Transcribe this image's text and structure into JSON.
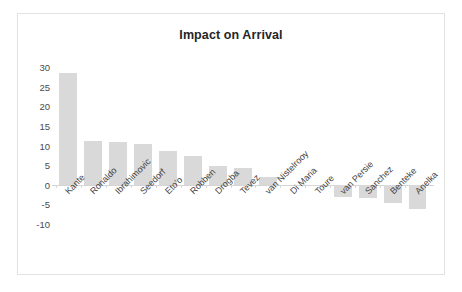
{
  "chart": {
    "title": "Impact on Arrival"
  },
  "chart_data": {
    "type": "bar",
    "title": "Impact on Arrival",
    "xlabel": "",
    "ylabel": "",
    "ylim": [
      -10,
      30
    ],
    "yticks": [
      30,
      25,
      20,
      15,
      10,
      5,
      0,
      -5,
      -10
    ],
    "grid": false,
    "legend": false,
    "bar_color": "#d9d9d9",
    "categories": [
      "Kante",
      "Ronaldo",
      "Ibrahimovic",
      "Seedorf",
      "Eto'o",
      "Robben",
      "Drogba",
      "Tevez",
      "van Nistelrooy",
      "Di Maria",
      "Toure",
      "van Persie",
      "Sanchez",
      "Benteke",
      "Anelka"
    ],
    "values": [
      28.4,
      11.1,
      10.8,
      10.4,
      8.6,
      7.2,
      4.8,
      4.3,
      2.0,
      0.0,
      -0.1,
      -3.2,
      -3.3,
      -4.7,
      -6.3
    ]
  }
}
